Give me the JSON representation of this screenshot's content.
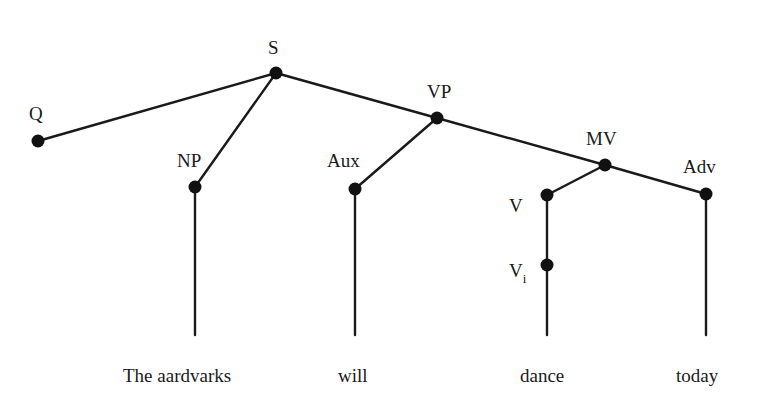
{
  "diagram": {
    "type": "syntax-tree",
    "nodes": [
      {
        "id": "S",
        "label": "S",
        "x": 276,
        "y": 73
      },
      {
        "id": "Q",
        "label": "Q",
        "x": 38,
        "y": 141
      },
      {
        "id": "NP",
        "label": "NP",
        "x": 195,
        "y": 187
      },
      {
        "id": "VP",
        "label": "VP",
        "x": 437,
        "y": 118
      },
      {
        "id": "Aux",
        "label": "Aux",
        "x": 355,
        "y": 189
      },
      {
        "id": "MV",
        "label": "MV",
        "x": 605,
        "y": 165
      },
      {
        "id": "V",
        "label": "V",
        "x": 547,
        "y": 195
      },
      {
        "id": "Vi",
        "label": "V",
        "subscript": "i",
        "x": 547,
        "y": 265
      },
      {
        "id": "Adv",
        "label": "Adv",
        "x": 706,
        "y": 194
      }
    ],
    "edges": [
      [
        "S",
        "Q"
      ],
      [
        "S",
        "NP"
      ],
      [
        "S",
        "VP"
      ],
      [
        "VP",
        "Aux"
      ],
      [
        "VP",
        "MV"
      ],
      [
        "MV",
        "V"
      ],
      [
        "MV",
        "Adv"
      ],
      [
        "V",
        "Vi"
      ]
    ],
    "leaves": [
      {
        "parent": "NP",
        "text": "The aardvarks"
      },
      {
        "parent": "Aux",
        "text": "will"
      },
      {
        "parent": "Vi",
        "text": "dance"
      },
      {
        "parent": "Adv",
        "text": "today"
      }
    ]
  },
  "labels": {
    "S": "S",
    "Q": "Q",
    "NP": "NP",
    "VP": "VP",
    "Aux": "Aux",
    "MV": "MV",
    "V": "V",
    "Vi": "V",
    "Vi_sub": "i",
    "Adv": "Adv"
  },
  "words": {
    "np": "The aardvarks",
    "aux": "will",
    "vi": "dance",
    "adv": "today"
  }
}
